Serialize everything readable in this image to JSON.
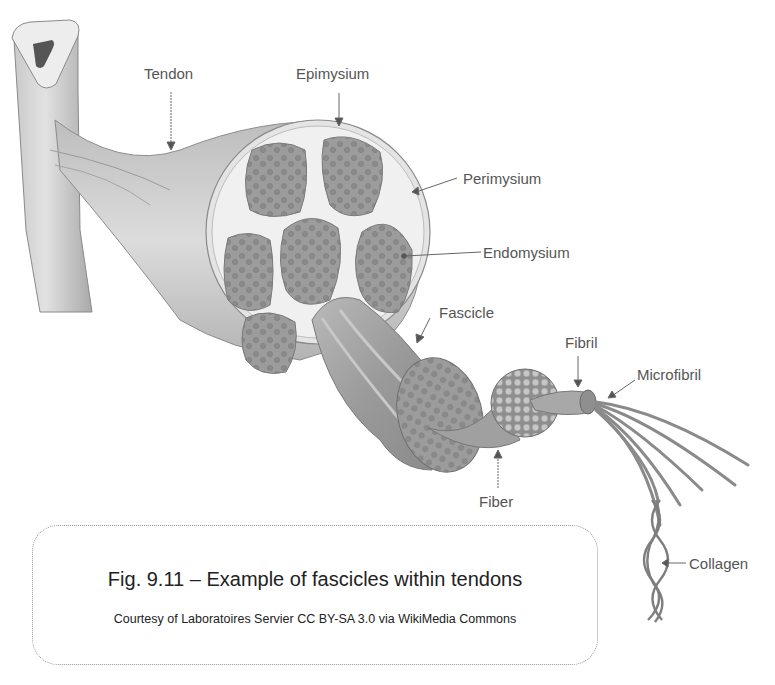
{
  "figure": {
    "labels": {
      "tendon": "Tendon",
      "epimysium": "Epimysium",
      "perimysium": "Perimysium",
      "endomysium": "Endomysium",
      "fascicle": "Fascicle",
      "fibril": "Fibril",
      "microfibril": "Microfibril",
      "fiber": "Fiber",
      "collagen": "Collagen"
    },
    "colors": {
      "tissue_light": "#d4d4d4",
      "tissue_mid": "#a8a8a8",
      "tissue_dark": "#7e7e7e",
      "sheath": "#ececec",
      "label_text": "#555555",
      "leader_line": "#666666"
    }
  },
  "caption": {
    "title": "Fig. 9.11 – Example of fascicles within tendons",
    "credit": "Courtesy of Laboratoires Servier CC BY-SA 3.0 via WikiMedia Commons"
  }
}
